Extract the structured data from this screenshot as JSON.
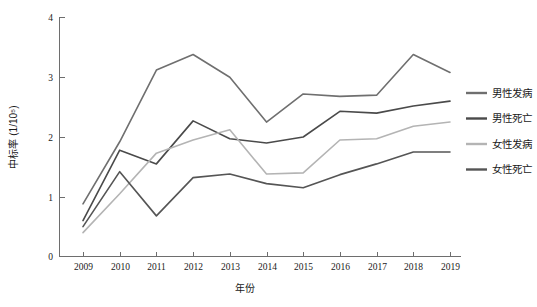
{
  "chart_data": {
    "type": "line",
    "title": "",
    "xlabel": "年份",
    "ylabel": "中标率 (1/10⁵)",
    "x": [
      2009,
      2010,
      2011,
      2012,
      2013,
      2014,
      2015,
      2016,
      2017,
      2018,
      2019
    ],
    "categories": [
      "2009",
      "2010",
      "2011",
      "2012",
      "2013",
      "2014",
      "2015",
      "2016",
      "2017",
      "2018",
      "2019"
    ],
    "xlim": [
      2009,
      2019
    ],
    "ylim": [
      0,
      4
    ],
    "yticks": [
      0,
      1,
      2,
      3,
      4
    ],
    "ytick_labels": [
      "0",
      "1",
      "2",
      "3",
      "4"
    ],
    "grid": false,
    "legend_position": "right",
    "series": [
      {
        "name": "男性发病",
        "color": "#6f6f6f",
        "values": [
          0.88,
          1.92,
          3.12,
          3.38,
          3.0,
          2.25,
          2.72,
          2.68,
          2.7,
          3.38,
          3.08
        ]
      },
      {
        "name": "男性死亡",
        "color": "#4a4a4a",
        "values": [
          0.6,
          1.78,
          1.55,
          2.27,
          1.97,
          1.9,
          2.0,
          2.43,
          2.4,
          2.52,
          2.6
        ]
      },
      {
        "name": "女性发病",
        "color": "#b4b4b4",
        "values": [
          0.4,
          1.05,
          1.73,
          1.95,
          2.12,
          1.38,
          1.4,
          1.95,
          1.97,
          2.18,
          2.25
        ]
      },
      {
        "name": "女性死亡",
        "color": "#555555",
        "values": [
          0.5,
          1.42,
          0.68,
          1.32,
          1.38,
          1.22,
          1.15,
          1.37,
          1.55,
          1.75,
          1.75
        ]
      }
    ]
  },
  "legend": {
    "items": [
      {
        "label": "男性发病"
      },
      {
        "label": "男性死亡"
      },
      {
        "label": "女性发病"
      },
      {
        "label": "女性死亡"
      }
    ]
  }
}
